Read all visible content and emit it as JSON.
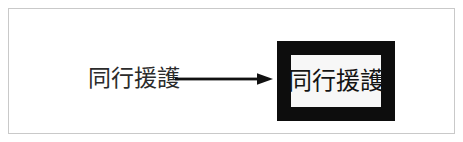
{
  "figure": {
    "background_color": "#ffffff",
    "frame": {
      "border_color": "#c9c9c9"
    },
    "source_term": {
      "text": "同行援護",
      "color": "#2b2b2b"
    },
    "arrow": {
      "icon": "right-arrow-icon",
      "direction": "right",
      "color": "#111111"
    },
    "highlighted_term": {
      "text": "同行援護",
      "text_color": "#141414",
      "box_border_color": "#0d0d0d",
      "box_fill_color": "#f7f7f7"
    }
  }
}
